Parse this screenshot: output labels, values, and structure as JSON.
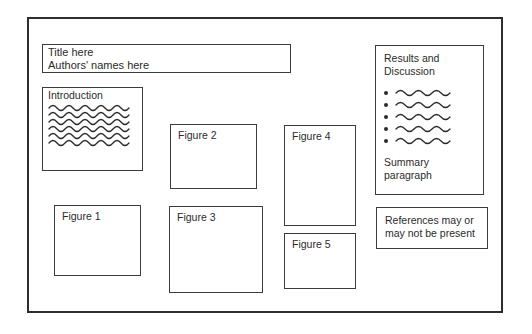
{
  "colors": {
    "background": "#ffffff",
    "frame_border": "#2e2e2e",
    "box_border": "#3c3c3c",
    "ink": "#2b2b2b"
  },
  "poster": {
    "title_block": {
      "lines": [
        "Title here",
        "Authors' names here"
      ]
    },
    "introduction": {
      "heading": "Introduction",
      "squiggle_count": 6
    },
    "figures": [
      {
        "label": "Figure 1"
      },
      {
        "label": "Figure 2"
      },
      {
        "label": "Figure 3"
      },
      {
        "label": "Figure 4"
      },
      {
        "label": "Figure 5"
      }
    ],
    "results": {
      "heading_lines": [
        "Results and",
        "Discussion"
      ],
      "bullet_count": 5,
      "summary_lines": [
        "Summary",
        "paragraph"
      ]
    },
    "references": {
      "lines": [
        "References may or",
        "may not be present"
      ]
    }
  }
}
